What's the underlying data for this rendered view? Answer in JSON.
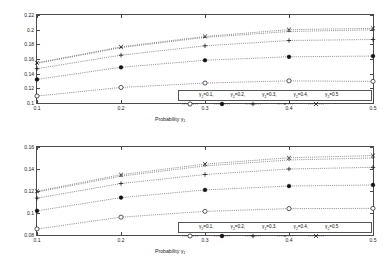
{
  "figure": {
    "xlabel": "Probability γ",
    "xlabel_sub": "1",
    "legend_var": "γ",
    "legend_sub": "2"
  },
  "chart_data": [
    {
      "type": "line",
      "title": "Filtering error variances",
      "xlabel": "Probability γ1",
      "ylabel": "",
      "xlim": [
        0.1,
        0.5
      ],
      "ylim": [
        0.1,
        0.22
      ],
      "xticks": [
        0.1,
        0.2,
        0.3,
        0.4,
        0.5
      ],
      "xticklabels": [
        "0.1",
        "0.2",
        "0.3",
        "0.4",
        "0.5"
      ],
      "yticks": [
        0.1,
        0.12,
        0.14,
        0.16,
        0.18,
        0.2,
        0.22
      ],
      "yticklabels": [
        "0.1",
        "0.12",
        "0.14",
        "0.16",
        "0.18",
        "0.2",
        "0.22"
      ],
      "grid": false,
      "legend_position": "lower right",
      "x": [
        0.1,
        0.2,
        0.3,
        0.4,
        0.5
      ],
      "series": [
        {
          "name": "γ2=0.1,",
          "label_value": "0.1",
          "marker": "circle",
          "values": [
            0.1095,
            0.1212,
            0.1272,
            0.1302,
            0.1295
          ]
        },
        {
          "name": "γ2=0.2,",
          "label_value": "0.2",
          "marker": "dot-filled",
          "values": [
            0.1322,
            0.1487,
            0.1583,
            0.163,
            0.164
          ]
        },
        {
          "name": "γ2=0.3,",
          "label_value": "0.3",
          "marker": "plus",
          "values": [
            0.1468,
            0.1652,
            0.178,
            0.1852,
            0.1866
          ]
        },
        {
          "name": "γ2=0.4,",
          "label_value": "0.4",
          "marker": "point",
          "values": [
            0.154,
            0.1755,
            0.1895,
            0.1975,
            0.1998
          ]
        },
        {
          "name": "γ2=0.5",
          "label_value": "0.5",
          "marker": "cross",
          "values": [
            0.1548,
            0.1766,
            0.1908,
            0.2,
            0.2018
          ]
        }
      ]
    },
    {
      "type": "line",
      "title": "Smoothing error variances",
      "xlabel": "Probability γ1",
      "ylabel": "",
      "xlim": [
        0.1,
        0.5
      ],
      "ylim": [
        0.08,
        0.16
      ],
      "xticks": [
        0.1,
        0.2,
        0.3,
        0.4,
        0.5
      ],
      "xticklabels": [
        "0.1",
        "0.2",
        "0.3",
        "0.4",
        "0.5"
      ],
      "yticks": [
        0.08,
        0.1,
        0.12,
        0.14,
        0.16
      ],
      "yticklabels": [
        "0.08",
        "0.1",
        "0.12",
        "0.14",
        "0.16"
      ],
      "grid": false,
      "legend_position": "lower right",
      "x": [
        0.1,
        0.2,
        0.3,
        0.4,
        0.5
      ],
      "series": [
        {
          "name": "γ2=0.1,",
          "label_value": "0.1",
          "marker": "circle",
          "values": [
            0.0855,
            0.0962,
            0.1015,
            0.104,
            0.1042
          ]
        },
        {
          "name": "γ2=0.2,",
          "label_value": "0.2",
          "marker": "dot-filled",
          "values": [
            0.102,
            0.114,
            0.121,
            0.1245,
            0.1255
          ]
        },
        {
          "name": "γ2=0.3,",
          "label_value": "0.3",
          "marker": "plus",
          "values": [
            0.1135,
            0.1268,
            0.135,
            0.14,
            0.1415
          ]
        },
        {
          "name": "γ2=0.4,",
          "label_value": "0.4",
          "marker": "point",
          "values": [
            0.119,
            0.1335,
            0.1428,
            0.1482,
            0.15
          ]
        },
        {
          "name": "γ2=0.5",
          "label_value": "0.5",
          "marker": "cross",
          "values": [
            0.1198,
            0.1348,
            0.1445,
            0.1502,
            0.1522
          ]
        }
      ]
    }
  ]
}
